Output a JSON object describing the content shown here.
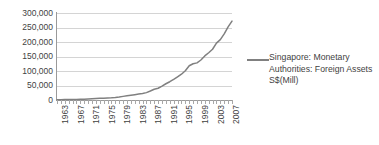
{
  "chart_data": {
    "type": "line",
    "title": "",
    "xlabel": "",
    "ylabel": "",
    "ylim": [
      0,
      300000
    ],
    "grid": true,
    "legend_position": "right",
    "y_ticks": [
      "0",
      "50,000",
      "100,000",
      "150,000",
      "200,000",
      "250,000",
      "300,000"
    ],
    "y_tick_values": [
      0,
      50000,
      100000,
      150000,
      200000,
      250000,
      300000
    ],
    "x_tick_labels": [
      "1963",
      "1967",
      "1971",
      "1975",
      "1979",
      "1983",
      "1987",
      "1991",
      "1995",
      "1999",
      "2003",
      "2007"
    ],
    "x_tick_values": [
      1963,
      1967,
      1971,
      1975,
      1979,
      1983,
      1987,
      1991,
      1995,
      1999,
      2003,
      2007
    ],
    "xlim": [
      1963,
      2008
    ],
    "series": [
      {
        "name": "Singapore: Monetary Authorities: Foreign Assets S$(Mill)",
        "color": "#808080",
        "x": [
          1963,
          1964,
          1965,
          1966,
          1967,
          1968,
          1969,
          1970,
          1971,
          1972,
          1973,
          1974,
          1975,
          1976,
          1977,
          1978,
          1979,
          1980,
          1981,
          1982,
          1983,
          1984,
          1985,
          1986,
          1987,
          1988,
          1989,
          1990,
          1991,
          1992,
          1993,
          1994,
          1995,
          1996,
          1997,
          1998,
          1999,
          2000,
          2001,
          2002,
          2003,
          2004,
          2005,
          2006,
          2007,
          2008
        ],
        "values": [
          1100,
          1200,
          1300,
          1500,
          1700,
          2000,
          2400,
          2900,
          3600,
          4500,
          5200,
          5800,
          6300,
          7000,
          7800,
          9000,
          10500,
          12500,
          14500,
          16500,
          18500,
          20500,
          22500,
          25500,
          31000,
          37000,
          40500,
          48000,
          56000,
          63000,
          71000,
          80000,
          89000,
          101000,
          118000,
          125000,
          128000,
          138000,
          152000,
          163000,
          175000,
          196000,
          208000,
          228000,
          252000,
          272000
        ]
      }
    ]
  },
  "legend": {
    "entries": [
      {
        "label": "Singapore: Monetary Authorities: Foreign Assets S$(Mill)",
        "marker": "line-marker",
        "color": "#808080"
      }
    ]
  },
  "colors": {
    "series_line": "#808080",
    "gridline": "#d4d4d4",
    "axis": "#9a9a9a",
    "text": "#3f3f3f",
    "background": "#ffffff"
  }
}
